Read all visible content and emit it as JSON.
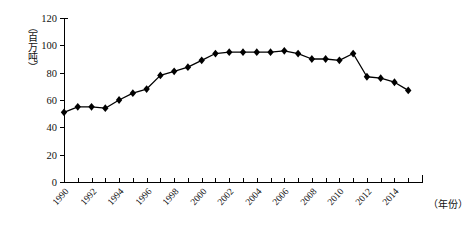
{
  "chart_data": {
    "type": "line",
    "title": "",
    "xlabel": "（年份）",
    "ylabel": "（百万吨）",
    "x": [
      1990,
      1991,
      1992,
      1993,
      1994,
      1995,
      1996,
      1997,
      1998,
      1999,
      2000,
      2001,
      2002,
      2003,
      2004,
      2005,
      2006,
      2007,
      2008,
      2009,
      2010,
      2011,
      2012,
      2013,
      2014,
      2015
    ],
    "values": [
      51,
      55,
      55,
      54,
      60,
      65,
      68,
      78,
      81,
      84,
      89,
      94,
      95,
      95,
      95,
      95,
      96,
      94,
      90,
      90,
      89,
      94,
      77,
      76,
      73,
      67
    ],
    "series": [
      {
        "name": "",
        "values": [
          51,
          55,
          55,
          54,
          60,
          65,
          68,
          78,
          81,
          84,
          89,
          94,
          95,
          95,
          95,
          95,
          96,
          94,
          90,
          90,
          89,
          94,
          77,
          76,
          73,
          67
        ]
      }
    ],
    "xlim": [
      1990,
      2016
    ],
    "ylim": [
      0,
      120
    ],
    "yticks": [
      0,
      20,
      40,
      60,
      80,
      100,
      120
    ],
    "xticks": [
      1990,
      1992,
      1994,
      1996,
      1998,
      2000,
      2002,
      2004,
      2006,
      2008,
      2010,
      2012,
      2014
    ],
    "xtick_labels": [
      "1990",
      "1992",
      "1994",
      "1996",
      "1998",
      "2000",
      "2002",
      "2004",
      "2006",
      "2008",
      "2010",
      "2012",
      "2014"
    ],
    "grid": false,
    "legend": null,
    "marker": "diamond",
    "line_color": "#000000",
    "marker_color": "#000000"
  },
  "axes": {
    "y_unit_label": "（百万吨）",
    "x_unit_label": "（年份）",
    "y_tick_labels": [
      "0",
      "20",
      "40",
      "60",
      "80",
      "100",
      "120"
    ]
  }
}
